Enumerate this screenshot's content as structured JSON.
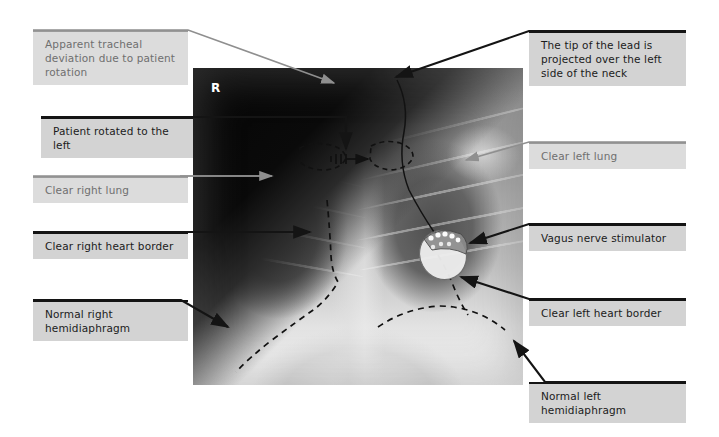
{
  "figure": {
    "type": "annotated-chest-radiograph",
    "orientation_marker": "R",
    "colors": {
      "label_fill_dark": "#d3d3d3",
      "label_fill_light": "#dcdcdc",
      "label_text_dark": "#1b1b1b",
      "label_text_light": "#6f6f6f",
      "leader_dark": "#141414",
      "leader_light": "#8f8f8f",
      "page_background": "#ffffff"
    }
  },
  "annotations": [
    {
      "id": "apparent-tracheal-deviation",
      "text": "Apparent tracheal\ndeviation due to patient\nrotation",
      "style": "light",
      "side": "left"
    },
    {
      "id": "patient-rotated-left",
      "text": "Patient rotated to the left",
      "style": "dark",
      "side": "left"
    },
    {
      "id": "clear-right-lung",
      "text": "Clear right lung",
      "style": "light",
      "side": "left"
    },
    {
      "id": "clear-right-heart-border",
      "text": "Clear right heart border",
      "style": "dark",
      "side": "left"
    },
    {
      "id": "normal-right-hemidiaphragm",
      "text": "Normal right\nhemidiaphragm",
      "style": "dark",
      "side": "left"
    },
    {
      "id": "lead-tip-left-neck",
      "text": "The tip of the lead is\nprojected over the left\nside of the neck",
      "style": "dark",
      "side": "right"
    },
    {
      "id": "clear-left-lung",
      "text": "Clear left lung",
      "style": "light",
      "side": "right"
    },
    {
      "id": "vagus-nerve-stimulator",
      "text": "Vagus nerve stimulator",
      "style": "dark",
      "side": "right"
    },
    {
      "id": "clear-left-heart-border",
      "text": "Clear left heart border",
      "style": "dark",
      "side": "right"
    },
    {
      "id": "normal-left-hemidiaphragm",
      "text": "Normal left\nhemidiaphragm",
      "style": "dark",
      "side": "right"
    }
  ]
}
